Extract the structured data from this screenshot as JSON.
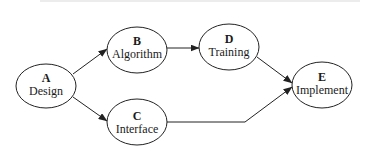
{
  "diagram": {
    "type": "flow",
    "nodes": [
      {
        "id": "A",
        "letter": "A",
        "label": "Design",
        "cx": 46,
        "cy": 86,
        "rx": 30,
        "ry": 22
      },
      {
        "id": "B",
        "letter": "B",
        "label": "Algorithm",
        "cx": 137,
        "cy": 51,
        "rx": 30,
        "ry": 23
      },
      {
        "id": "C",
        "letter": "C",
        "label": "Interface",
        "cx": 137,
        "cy": 122,
        "rx": 30,
        "ry": 23
      },
      {
        "id": "D",
        "letter": "D",
        "label": "Training",
        "cx": 229,
        "cy": 47,
        "rx": 30,
        "ry": 23
      },
      {
        "id": "E",
        "letter": "E",
        "label": "Implement",
        "cx": 322,
        "cy": 85,
        "rx": 30,
        "ry": 23
      }
    ],
    "edges": [
      {
        "from": "A",
        "to": "B"
      },
      {
        "from": "A",
        "to": "C"
      },
      {
        "from": "B",
        "to": "D"
      },
      {
        "from": "D",
        "to": "E"
      },
      {
        "from": "C",
        "to": "E"
      }
    ],
    "colors": {
      "stroke": "#222222",
      "fill": "#ffffff",
      "text": "#1a1a1a"
    }
  }
}
